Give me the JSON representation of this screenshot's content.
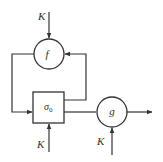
{
  "diagram": {
    "type": "block-diagram",
    "colors": {
      "line": "#333333",
      "background": "#ffffff"
    },
    "nodes": {
      "f": {
        "label": "f",
        "shape": "circle"
      },
      "sigma": {
        "label": "σ",
        "subscript": "0",
        "shape": "box"
      },
      "g": {
        "label": "g",
        "shape": "circle"
      }
    },
    "inputs": {
      "k_top": "K",
      "k_sigma": "K",
      "k_g": "K"
    },
    "edges": [
      {
        "from": "K",
        "to": "f"
      },
      {
        "from": "f",
        "to": "sigma",
        "route": "left feedback loop"
      },
      {
        "from": "sigma",
        "to": "f",
        "route": "right feedback loop"
      },
      {
        "from": "K",
        "to": "sigma"
      },
      {
        "from": "sigma",
        "to": "g"
      },
      {
        "from": "K",
        "to": "g"
      },
      {
        "from": "g",
        "to": "output"
      }
    ]
  }
}
